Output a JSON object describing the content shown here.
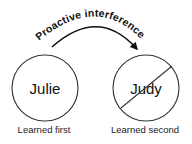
{
  "diagram": {
    "title": "Proactive interference",
    "arrow": {
      "label": "Proactive interference",
      "direction": "left-to-right",
      "color": "#111111"
    },
    "nodes": [
      {
        "name": "Julie",
        "caption": "Learned first",
        "crossed_out": false
      },
      {
        "name": "Judy",
        "caption": "Learned second",
        "crossed_out": true
      }
    ],
    "colors": {
      "stroke": "#333333",
      "text": "#111111",
      "background": "#ffffff"
    }
  }
}
